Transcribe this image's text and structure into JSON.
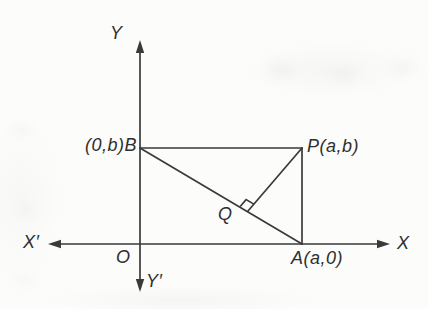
{
  "figure": {
    "ink_color": "#3a3a3a",
    "label_color": "#2f2f2f",
    "background_color": "#fcfcfb",
    "axes": {
      "x_axis": {
        "y": 244,
        "x_start": 48,
        "x_end": 390,
        "label_positive": "X",
        "label_negative": "X′"
      },
      "y_axis": {
        "x": 140,
        "y_start": 40,
        "y_end": 292,
        "label_positive": "Y",
        "label_negative": "Y′"
      },
      "origin_label": "O"
    },
    "points": {
      "B": {
        "x": 140,
        "y": 148,
        "label": "(0,b)B"
      },
      "P": {
        "x": 302,
        "y": 148,
        "label": "P(a,b)"
      },
      "A": {
        "x": 302,
        "y": 244,
        "label": "A(a,0)"
      },
      "Q": {
        "x": 248,
        "y": 211,
        "label": "Q"
      }
    },
    "segments": [
      [
        "B",
        "P"
      ],
      [
        "P",
        "A"
      ],
      [
        "B",
        "A"
      ],
      [
        "P",
        "Q"
      ]
    ],
    "right_angle_mark": {
      "at": "Q",
      "arms": [
        "B",
        "P"
      ],
      "size": 9
    }
  }
}
